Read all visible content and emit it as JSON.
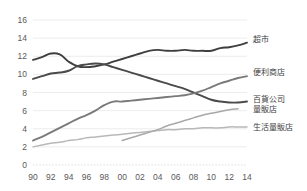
{
  "chart_data": {
    "type": "line",
    "title": "",
    "subtitle": "",
    "xlabel": "",
    "ylabel": "",
    "xlim": [
      1990,
      2014
    ],
    "ylim": [
      0,
      16
    ],
    "grid": true,
    "legend_position": "right",
    "x_tick_labels": [
      "90",
      "92",
      "94",
      "96",
      "98",
      "00",
      "02",
      "04",
      "06",
      "08",
      "10",
      "12",
      "14"
    ],
    "x_tick_values": [
      1990,
      1992,
      1994,
      1996,
      1998,
      2000,
      2002,
      2004,
      2006,
      2008,
      2010,
      2012,
      2014
    ],
    "y_tick_labels": [
      "0",
      "2",
      "4",
      "6",
      "8",
      "10",
      "12",
      "14",
      "16"
    ],
    "y_tick_values": [
      0,
      2,
      4,
      6,
      8,
      10,
      12,
      14,
      16
    ],
    "series": [
      {
        "name": "超市",
        "color": "#3f3f3f",
        "x": [
          1990,
          1991,
          1992,
          1993,
          1994,
          1995,
          1996,
          1997,
          1998,
          1999,
          2000,
          2001,
          2002,
          2003,
          2004,
          2005,
          2006,
          2007,
          2008,
          2009,
          2010,
          2011,
          2012,
          2013,
          2014
        ],
        "values": [
          11.6,
          11.9,
          12.3,
          12.2,
          11.4,
          10.9,
          10.8,
          10.9,
          11.1,
          11.4,
          11.7,
          12.0,
          12.3,
          12.6,
          12.7,
          12.6,
          12.6,
          12.7,
          12.6,
          12.6,
          12.6,
          12.9,
          13.0,
          13.2,
          13.5
        ]
      },
      {
        "name": "便利商店",
        "color": "#4a4a4a",
        "x": [
          1990,
          1991,
          1992,
          1993,
          1994,
          1995,
          1996,
          1997,
          1998,
          1999,
          2000,
          2001,
          2002,
          2003,
          2004,
          2005,
          2006,
          2007,
          2008,
          2009,
          2010,
          2011,
          2012,
          2013,
          2014
        ],
        "values": [
          9.5,
          9.8,
          10.1,
          10.2,
          10.4,
          10.9,
          11.1,
          11.2,
          11.1,
          10.8,
          10.5,
          10.2,
          9.9,
          9.6,
          9.3,
          9.0,
          8.7,
          8.4,
          8.0,
          7.6,
          7.2,
          7.0,
          6.9,
          6.9,
          7.0
        ]
      },
      {
        "name": "百貨公司\n量販店",
        "color": "#7a7a7a",
        "x": [
          1990,
          1991,
          1992,
          1993,
          1994,
          1995,
          1996,
          1997,
          1998,
          1999,
          2000,
          2001,
          2002,
          2003,
          2004,
          2005,
          2006,
          2007,
          2008,
          2009,
          2010,
          2011,
          2012,
          2013,
          2014
        ],
        "values": [
          2.7,
          3.1,
          3.6,
          4.1,
          4.6,
          5.1,
          5.5,
          6.0,
          6.6,
          7.0,
          7.0,
          7.1,
          7.2,
          7.3,
          7.4,
          7.5,
          7.6,
          7.7,
          7.9,
          8.2,
          8.6,
          9.0,
          9.3,
          9.6,
          9.8
        ]
      },
      {
        "name": "生活量販店",
        "color": "#b8b8b8",
        "x": [
          1990,
          1991,
          1992,
          1993,
          1994,
          1995,
          1996,
          1997,
          1998,
          1999,
          2000,
          2001,
          2002,
          2003,
          2004,
          2005,
          2006,
          2007,
          2008,
          2009,
          2010,
          2011,
          2012,
          2013,
          2014
        ],
        "values": [
          2.0,
          2.2,
          2.4,
          2.5,
          2.7,
          2.8,
          3.0,
          3.1,
          3.2,
          3.3,
          3.4,
          3.5,
          3.6,
          3.7,
          3.8,
          3.9,
          3.9,
          4.0,
          4.0,
          4.1,
          4.1,
          4.1,
          4.2,
          4.2,
          4.2
        ]
      },
      {
        "name": "",
        "color": "#a8a8a8",
        "x": [
          2000,
          2001,
          2002,
          2003,
          2004,
          2005,
          2006,
          2007,
          2008,
          2009,
          2010,
          2011,
          2012,
          2013
        ],
        "values": [
          2.7,
          3.0,
          3.3,
          3.6,
          3.9,
          4.3,
          4.6,
          4.9,
          5.2,
          5.5,
          5.7,
          5.9,
          6.1,
          6.2
        ]
      }
    ],
    "legend_entries": [
      {
        "label": "超市",
        "color": "#3f3f3f",
        "value_at_end": 13.5
      },
      {
        "label": "便利商店",
        "color": "#4a4a4a",
        "value_at_end": 7.0
      },
      {
        "label": "百貨公司",
        "label2": "量販店",
        "color": "#7a7a7a",
        "value_at_end": 9.8
      },
      {
        "label": "生活量販店",
        "color": "#b8b8b8",
        "value_at_end": 4.2
      }
    ]
  },
  "legend": {
    "item0": "超市",
    "item1": "便利商店",
    "item2_line1": "百貨公司",
    "item2_line2": "量販店",
    "item3": "生活量販店"
  },
  "axes": {
    "y0": "0",
    "y1": "2",
    "y2": "4",
    "y3": "6",
    "y4": "8",
    "y5": "10",
    "y6": "12",
    "y7": "14",
    "y8": "16",
    "x0": "90",
    "x1": "92",
    "x2": "94",
    "x3": "96",
    "x4": "98",
    "x5": "00",
    "x6": "02",
    "x7": "04",
    "x8": "06",
    "x9": "08",
    "x10": "10",
    "x11": "12",
    "x12": "14"
  }
}
